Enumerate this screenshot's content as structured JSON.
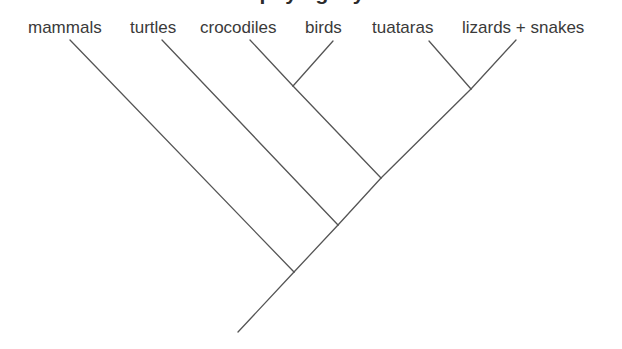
{
  "figure": {
    "title_fragment": "phylogeny",
    "background_color": "#ffffff",
    "line_color": "#555555",
    "text_color": "#3a3a3a"
  },
  "labels": {
    "mammals": "mammals",
    "turtles": "turtles",
    "crocodiles": "crocodiles",
    "birds": "birds",
    "tuataras": "tuataras",
    "lizards_snakes": "lizards + snakes"
  },
  "chart_data": {
    "type": "diagram",
    "diagram_type": "cladogram",
    "title": "phylogeny",
    "orientation": "tips-at-top, root-at-bottom",
    "taxa": [
      "mammals",
      "turtles",
      "crocodiles",
      "birds",
      "tuataras",
      "lizards + snakes"
    ],
    "newick": "(mammals,(turtles,((crocodiles,birds),(tuataras,(lizards + snakes)))));",
    "tips": [
      {
        "name": "mammals",
        "x": 70,
        "y": 40
      },
      {
        "name": "turtles",
        "x": 162,
        "y": 40
      },
      {
        "name": "crocodiles",
        "x": 250,
        "y": 40
      },
      {
        "name": "birds",
        "x": 333,
        "y": 41
      },
      {
        "name": "tuataras",
        "x": 429,
        "y": 41
      },
      {
        "name": "lizards + snakes",
        "x": 516,
        "y": 40
      }
    ],
    "internal_nodes": [
      {
        "name": "archosaurs",
        "children": [
          "crocodiles",
          "birds"
        ],
        "x": 293,
        "y": 86
      },
      {
        "name": "lepidosaurs",
        "children": [
          "tuataras",
          "lizards + snakes"
        ],
        "x": 471,
        "y": 89
      },
      {
        "name": "diapsids",
        "children": [
          "archosaurs",
          "lepidosaurs"
        ],
        "x": 381,
        "y": 178
      },
      {
        "name": "reptiles",
        "children": [
          "turtles",
          "diapsids"
        ],
        "x": 338,
        "y": 225
      },
      {
        "name": "amniotes",
        "children": [
          "mammals",
          "reptiles"
        ],
        "x": 294,
        "y": 272
      }
    ],
    "root_stem": {
      "from_x": 294,
      "from_y": 272,
      "to_x": 238,
      "to_y": 332
    },
    "branches": [
      {
        "from": "mammals",
        "to": "amniotes",
        "x1": 70,
        "y1": 40,
        "x2": 294,
        "y2": 272
      },
      {
        "from": "turtles",
        "to": "reptiles",
        "x1": 162,
        "y1": 40,
        "x2": 338,
        "y2": 225
      },
      {
        "from": "crocodiles",
        "to": "archosaurs",
        "x1": 250,
        "y1": 40,
        "x2": 293,
        "y2": 86
      },
      {
        "from": "birds",
        "to": "archosaurs",
        "x1": 333,
        "y1": 41,
        "x2": 293,
        "y2": 86
      },
      {
        "from": "tuataras",
        "to": "lepidosaurs",
        "x1": 429,
        "y1": 41,
        "x2": 471,
        "y2": 89
      },
      {
        "from": "lizards + snakes",
        "to": "lepidosaurs",
        "x1": 516,
        "y1": 40,
        "x2": 471,
        "y2": 89
      },
      {
        "from": "archosaurs",
        "to": "diapsids",
        "x1": 293,
        "y1": 86,
        "x2": 381,
        "y2": 178
      },
      {
        "from": "lepidosaurs",
        "to": "diapsids",
        "x1": 471,
        "y1": 89,
        "x2": 381,
        "y2": 178
      },
      {
        "from": "diapsids",
        "to": "reptiles",
        "x1": 381,
        "y1": 178,
        "x2": 338,
        "y2": 225
      },
      {
        "from": "reptiles",
        "to": "amniotes",
        "x1": 338,
        "y1": 225,
        "x2": 294,
        "y2": 272
      },
      {
        "from": "amniotes",
        "to": "root",
        "x1": 294,
        "y1": 272,
        "x2": 238,
        "y2": 332
      }
    ],
    "grid": false,
    "legend": "none"
  }
}
